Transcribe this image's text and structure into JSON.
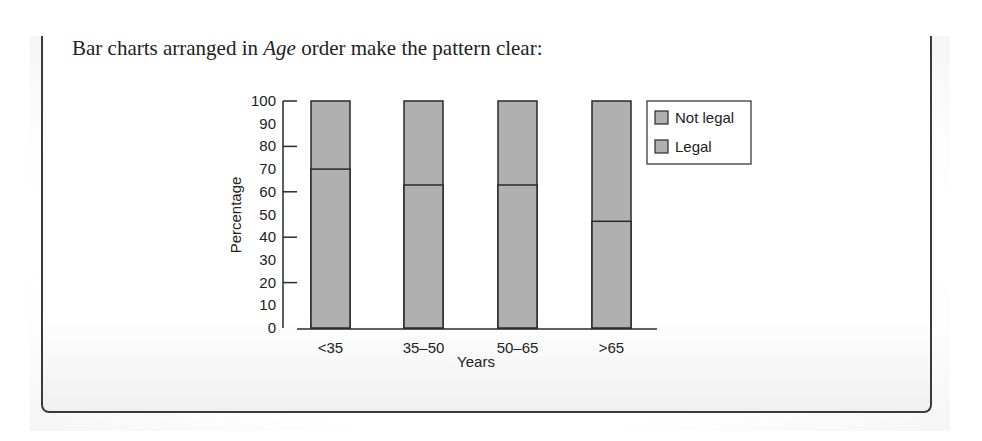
{
  "intro": {
    "before": "Bar charts arranged in ",
    "emph": "Age",
    "after": " order make the pattern clear:"
  },
  "colors": {
    "bar_fill": "#b0b0b0",
    "bar_stroke": "#2a2a2a",
    "axis": "#2a2a2a",
    "frame": "#3a3a3a"
  },
  "chart_data": {
    "type": "bar",
    "stacked": true,
    "percent": true,
    "title": "",
    "xlabel": "Years",
    "ylabel": "Percentage",
    "ylim": [
      0,
      100
    ],
    "yticks": [
      0,
      10,
      20,
      30,
      40,
      50,
      60,
      70,
      80,
      90,
      100
    ],
    "grid": false,
    "legend_position": "right",
    "categories": [
      "<35",
      "35–50",
      "50–65",
      ">65"
    ],
    "series": [
      {
        "name": "Legal",
        "values": [
          70,
          63,
          63,
          47
        ]
      },
      {
        "name": "Not legal",
        "values": [
          30,
          37,
          37,
          53
        ]
      }
    ],
    "legend": [
      "Not legal",
      "Legal"
    ]
  }
}
